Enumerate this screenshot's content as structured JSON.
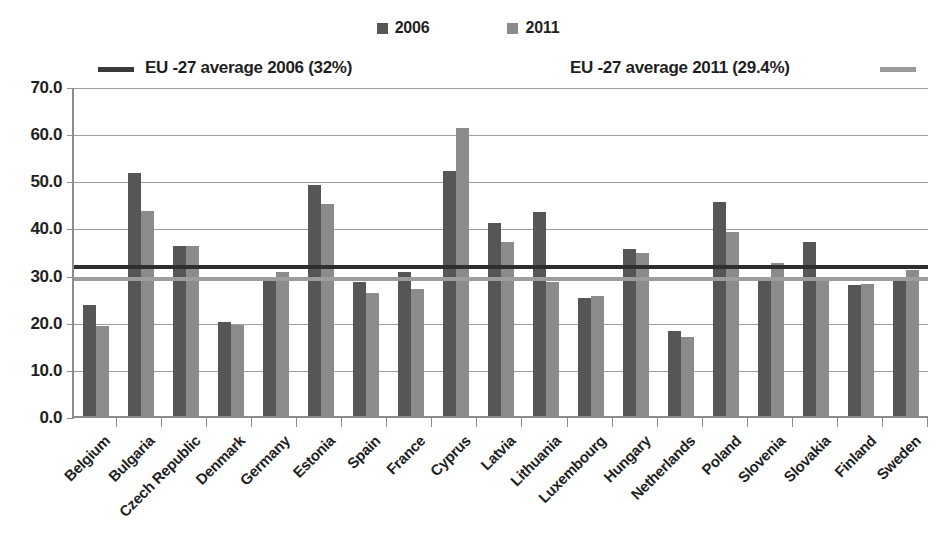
{
  "chart_data": {
    "type": "bar",
    "title": "",
    "subtitle": "",
    "xlabel": "",
    "ylabel": "",
    "ylim": [
      0,
      70
    ],
    "ytick_step": 10,
    "ytick_labels": [
      "0.0",
      "10.0",
      "20.0",
      "30.0",
      "40.0",
      "50.0",
      "60.0",
      "70.0"
    ],
    "ytick_values": [
      0,
      10,
      20,
      30,
      40,
      50,
      60,
      70
    ],
    "grid": true,
    "legend_position": "top",
    "categories": [
      "Belgium",
      "Bulgaria",
      "Czech Republic",
      "Denmark",
      "Germany",
      "Estonia",
      "Spain",
      "France",
      "Cyprus",
      "Latvia",
      "Lithuania",
      "Luxembourg",
      "Hungary",
      "Netherlands",
      "Poland",
      "Slovenia",
      "Slovakia",
      "Finland",
      "Sweden"
    ],
    "series": [
      {
        "name": "2006",
        "color": "#565656",
        "values": [
          23.5,
          51.5,
          36.0,
          20.0,
          29.5,
          49.0,
          28.5,
          30.5,
          52.0,
          41.0,
          43.2,
          25.0,
          35.5,
          18.0,
          45.3,
          29.0,
          37.0,
          27.8,
          28.8
        ]
      },
      {
        "name": "2011",
        "color": "#8b8b8b",
        "values": [
          19.0,
          43.5,
          36.0,
          19.3,
          30.5,
          45.0,
          26.0,
          27.0,
          61.0,
          37.0,
          28.5,
          25.5,
          34.5,
          16.7,
          39.0,
          32.5,
          29.5,
          28.0,
          31.0
        ]
      }
    ],
    "reference_lines": [
      {
        "name": "EU -27 average 2006 (32%)",
        "value": 32.0,
        "color": "#2e2e2e"
      },
      {
        "name": "EU -27 average 2011 (29.4%)",
        "value": 29.4,
        "color": "#9c9c9c"
      }
    ]
  },
  "legend": {
    "series": [
      {
        "label": "2006",
        "color": "#565656"
      },
      {
        "label": "2011",
        "color": "#8b8b8b"
      }
    ],
    "average_2006_label": "EU -27 average 2006 (32%)",
    "average_2011_label": "EU -27 average 2011 (29.4%)"
  }
}
